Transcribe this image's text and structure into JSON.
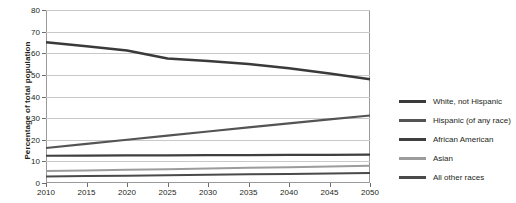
{
  "chart_data": {
    "type": "line",
    "title": "",
    "xlabel": "",
    "ylabel": "Percentage of total population",
    "x": [
      2010,
      2015,
      2020,
      2025,
      2030,
      2035,
      2040,
      2045,
      2050
    ],
    "xlim": [
      2010,
      2050
    ],
    "ylim": [
      0,
      80
    ],
    "yticks": [
      0,
      10,
      20,
      30,
      40,
      50,
      60,
      70,
      80
    ],
    "xticks": [
      "2010",
      "2015",
      "2020",
      "2025",
      "2030",
      "2035",
      "2040",
      "2045",
      "2050"
    ],
    "grid": true,
    "legend_position": "right",
    "series": [
      {
        "name": "White, not Hispanic",
        "color": "#3a3a3a",
        "width": 2.6,
        "values": [
          65.1,
          63.2,
          61.3,
          57.6,
          56.4,
          55.0,
          53.1,
          50.6,
          48.0
        ]
      },
      {
        "name": "Hispanic (of any race)",
        "color": "#545454",
        "width": 2.2,
        "values": [
          16.2,
          18.1,
          20.0,
          21.9,
          23.8,
          25.7,
          27.6,
          29.4,
          31.2
        ]
      },
      {
        "name": "African American",
        "color": "#3f3f3f",
        "width": 2.2,
        "values": [
          12.6,
          12.7,
          12.8,
          12.8,
          12.9,
          12.9,
          13.0,
          13.0,
          13.1
        ]
      },
      {
        "name": "Asian",
        "color": "#9c9c9c",
        "width": 2.0,
        "values": [
          5.5,
          5.8,
          6.1,
          6.4,
          6.7,
          7.0,
          7.3,
          7.6,
          8.0
        ]
      },
      {
        "name": "All other races",
        "color": "#4a4a4a",
        "width": 2.0,
        "values": [
          3.0,
          3.2,
          3.4,
          3.6,
          3.8,
          4.0,
          4.2,
          4.4,
          4.6
        ]
      }
    ]
  },
  "legend": {
    "items": [
      {
        "label": "White, not Hispanic",
        "color": "#3a3a3a"
      },
      {
        "label": "Hispanic (of any race)",
        "color": "#545454"
      },
      {
        "label": "African American",
        "color": "#3f3f3f"
      },
      {
        "label": "Asian",
        "color": "#9c9c9c"
      },
      {
        "label": "All other races",
        "color": "#4a4a4a"
      }
    ]
  }
}
